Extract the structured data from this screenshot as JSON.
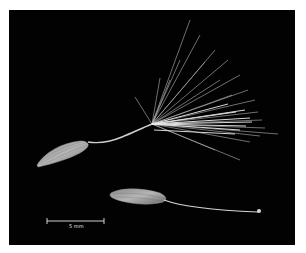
{
  "image": {
    "subject": "two seeds with pappus on black background",
    "background_color": "#020202",
    "frame_color": "#ffffff"
  },
  "scale_bar": {
    "label": "5 mm",
    "color": "#e6e6e6"
  }
}
